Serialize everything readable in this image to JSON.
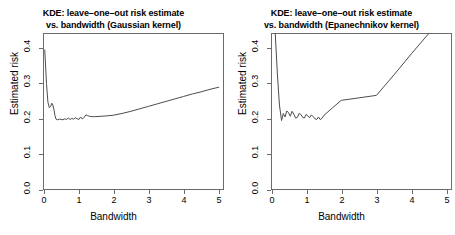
{
  "figure": {
    "background": "#ffffff",
    "line_color": "#4d4d4d",
    "frame_color": "#6b6b6b",
    "panel_count": 2
  },
  "panels": [
    {
      "id": "gaussian",
      "title_line1": "KDE: leave–one–out risk estimate",
      "title_line2": "vs. bandwidth (Gaussian kernel)",
      "xlabel": "Bandwidth",
      "ylabel": "Estimated risk",
      "xticks": [
        "0",
        "1",
        "2",
        "3",
        "4",
        "5"
      ],
      "yticks": [
        "0.0",
        "0.1",
        "0.2",
        "0.3",
        "0.4"
      ]
    },
    {
      "id": "epanechnikov",
      "title_line1": "KDE: leave–one–out risk estimate",
      "title_line2": "vs. bandwidth (Epanechnikov kernel)",
      "xlabel": "Bandwidth",
      "ylabel": "Estimated risk",
      "xticks": [
        "0",
        "1",
        "2",
        "3",
        "4",
        "5"
      ],
      "yticks": [
        "0.0",
        "0.1",
        "0.2",
        "0.3",
        "0.4"
      ]
    }
  ],
  "chart_data": [
    {
      "type": "line",
      "id": "gaussian",
      "title": "KDE: leave-one-out risk estimate vs. bandwidth (Gaussian kernel)",
      "xlabel": "Bandwidth",
      "ylabel": "Estimated risk",
      "xlim": [
        0,
        5.15
      ],
      "ylim": [
        0.0,
        0.443
      ],
      "xticks": [
        0,
        1,
        2,
        3,
        4,
        5
      ],
      "yticks": [
        0.0,
        0.1,
        0.2,
        0.3,
        0.4
      ],
      "grid": false,
      "legend": null,
      "series": [
        {
          "name": "LOO risk (Gaussian)",
          "x": [
            0.05,
            0.1,
            0.14,
            0.18,
            0.22,
            0.25,
            0.28,
            0.31,
            0.34,
            0.37,
            0.42,
            0.47,
            0.52,
            0.57,
            0.62,
            0.67,
            0.72,
            0.77,
            0.82,
            0.87,
            0.92,
            0.97,
            1.02,
            1.07,
            1.12,
            1.17,
            1.22,
            1.27,
            1.32,
            1.4,
            1.5,
            1.65,
            1.8,
            2.0,
            2.25,
            2.5,
            2.75,
            3.0,
            3.25,
            3.5,
            3.75,
            4.0,
            4.25,
            4.5,
            4.75,
            5.0
          ],
          "y": [
            0.395,
            0.3,
            0.248,
            0.232,
            0.236,
            0.245,
            0.24,
            0.228,
            0.21,
            0.2,
            0.198,
            0.2,
            0.199,
            0.198,
            0.201,
            0.199,
            0.203,
            0.199,
            0.202,
            0.2,
            0.204,
            0.201,
            0.199,
            0.206,
            0.2,
            0.205,
            0.212,
            0.21,
            0.208,
            0.207,
            0.207,
            0.208,
            0.209,
            0.211,
            0.216,
            0.222,
            0.229,
            0.236,
            0.243,
            0.25,
            0.257,
            0.264,
            0.271,
            0.277,
            0.284,
            0.29
          ]
        }
      ]
    },
    {
      "type": "line",
      "id": "epanechnikov",
      "title": "KDE: leave-one-out risk estimate vs. bandwidth (Epanechnikov kernel)",
      "xlabel": "Bandwidth",
      "ylabel": "Estimated risk",
      "xlim": [
        0,
        5.15
      ],
      "ylim": [
        0.0,
        0.443
      ],
      "xticks": [
        0,
        1,
        2,
        3,
        4,
        5
      ],
      "yticks": [
        0.0,
        0.1,
        0.2,
        0.3,
        0.4
      ],
      "grid": false,
      "legend": null,
      "note": "Curve is clipped by the top of the plot frame at both the left edge and near x = 4.5",
      "series": [
        {
          "name": "LOO risk (Epanechnikov)",
          "x": [
            0.12,
            0.18,
            0.24,
            0.3,
            0.35,
            0.4,
            0.45,
            0.5,
            0.55,
            0.6,
            0.65,
            0.7,
            0.75,
            0.8,
            0.85,
            0.9,
            0.95,
            1.0,
            1.05,
            1.1,
            1.15,
            1.2,
            1.25,
            1.3,
            1.35,
            1.4,
            1.45,
            1.5,
            1.75,
            2.0,
            2.5,
            3.0,
            3.5,
            4.0,
            4.5,
            5.0
          ],
          "y": [
            0.443,
            0.33,
            0.24,
            0.196,
            0.216,
            0.206,
            0.223,
            0.218,
            0.208,
            0.222,
            0.214,
            0.203,
            0.205,
            0.216,
            0.213,
            0.205,
            0.203,
            0.213,
            0.209,
            0.204,
            0.212,
            0.207,
            0.201,
            0.199,
            0.206,
            0.199,
            0.202,
            0.21,
            0.232,
            0.253,
            0.26,
            0.267,
            0.325,
            0.385,
            0.443,
            0.5
          ]
        }
      ]
    }
  ]
}
